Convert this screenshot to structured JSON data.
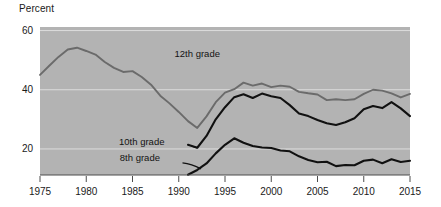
{
  "chart": {
    "ylabel": "Percent",
    "plot_background": "#b3b3b3",
    "grid_color": "#dcdcdc",
    "axis_color": "#4d4d4d"
  },
  "chart_data": {
    "type": "line",
    "title": "",
    "xlabel": "",
    "ylabel": "Percent",
    "xlim": [
      1975,
      2015
    ],
    "ylim": [
      11.2,
      61.2
    ],
    "yticks": [
      20,
      40,
      60
    ],
    "xticks": [
      1975,
      1980,
      1985,
      1990,
      1995,
      2000,
      2005,
      2010,
      2015
    ],
    "grid": "horizontal",
    "legend": "inline-annotations",
    "series": [
      {
        "name": "12th grade",
        "color": "#6b6b6b",
        "label_x": 1992,
        "label_y": 51,
        "x": [
          1975,
          1976,
          1977,
          1978,
          1979,
          1980,
          1981,
          1982,
          1983,
          1984,
          1985,
          1986,
          1987,
          1988,
          1989,
          1990,
          1991,
          1992,
          1993,
          1994,
          1995,
          1996,
          1997,
          1998,
          1999,
          2000,
          2001,
          2002,
          2003,
          2004,
          2005,
          2006,
          2007,
          2008,
          2009,
          2010,
          2011,
          2012,
          2013,
          2014,
          2015
        ],
        "values": [
          45.0,
          48.1,
          51.1,
          53.6,
          54.2,
          53.1,
          51.9,
          49.4,
          47.4,
          46.0,
          46.3,
          44.3,
          41.7,
          38.0,
          35.4,
          32.5,
          29.4,
          27.1,
          31.0,
          35.8,
          39.0,
          40.2,
          42.4,
          41.4,
          42.1,
          40.9,
          41.4,
          41.0,
          39.3,
          38.8,
          38.4,
          36.5,
          36.8,
          36.5,
          36.8,
          38.6,
          40.0,
          39.7,
          38.8,
          37.4,
          38.6
        ]
      },
      {
        "name": "10th grade",
        "color": "#111111",
        "label_x": 1986,
        "label_y": 21.5,
        "x": [
          1991,
          1992,
          1993,
          1994,
          1995,
          1996,
          1997,
          1998,
          1999,
          2000,
          2001,
          2002,
          2003,
          2004,
          2005,
          2006,
          2007,
          2008,
          2009,
          2010,
          2011,
          2012,
          2013,
          2014,
          2015
        ],
        "values": [
          21.4,
          20.4,
          24.4,
          30.0,
          34.1,
          37.5,
          38.5,
          37.2,
          38.7,
          37.8,
          37.2,
          34.8,
          32.0,
          31.1,
          29.8,
          28.7,
          28.1,
          29.0,
          30.4,
          33.4,
          34.5,
          33.8,
          35.8,
          33.7,
          31.1
        ]
      },
      {
        "name": "8th grade",
        "color": "#111111",
        "label_x": 1985.8,
        "label_y": 16,
        "x": [
          1991,
          1992,
          1993,
          1994,
          1995,
          1996,
          1997,
          1998,
          1999,
          2000,
          2001,
          2002,
          2003,
          2004,
          2005,
          2006,
          2007,
          2008,
          2009,
          2010,
          2011,
          2012,
          2013,
          2014,
          2015
        ],
        "values": [
          11.3,
          12.9,
          15.1,
          18.5,
          21.4,
          23.6,
          22.1,
          21.0,
          20.5,
          20.3,
          19.5,
          19.2,
          17.5,
          16.3,
          15.5,
          15.7,
          14.2,
          14.6,
          14.5,
          16.0,
          16.4,
          15.2,
          16.5,
          15.6,
          16.0
        ]
      }
    ]
  }
}
